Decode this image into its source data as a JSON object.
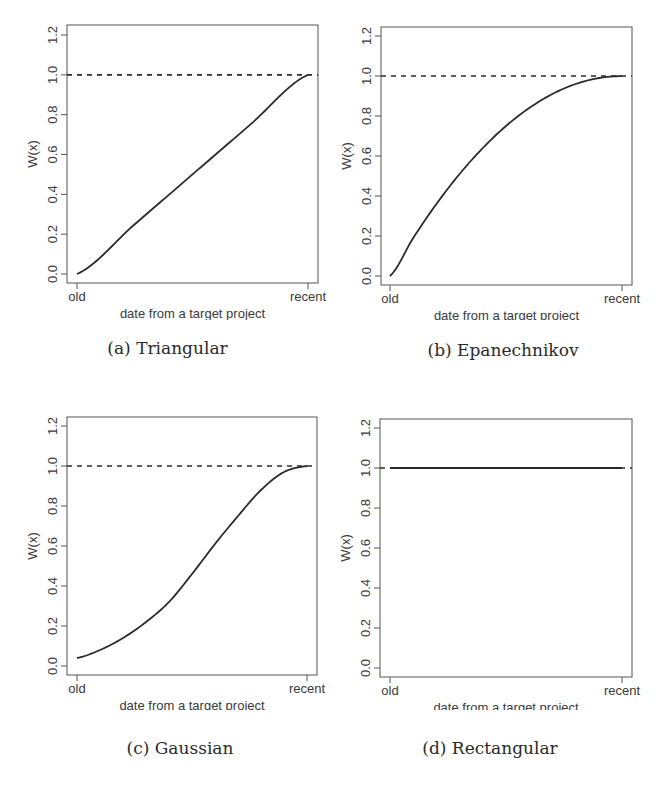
{
  "figure": {
    "panels": [
      {
        "caption": "(a) Triangular"
      },
      {
        "caption": "(b) Epanechnikov"
      },
      {
        "caption": "(c) Gaussian"
      },
      {
        "caption": "(d) Rectangular"
      }
    ]
  },
  "chart_data": [
    {
      "type": "line",
      "title": "(a) Triangular",
      "xlabel": "date from a target project",
      "ylabel": "W(x)",
      "x_tick_labels": [
        "old",
        "recent"
      ],
      "y_ticks": [
        "0.0",
        "0.2",
        "0.4",
        "0.6",
        "0.8",
        "1.0",
        "1.2"
      ],
      "ylim": [
        0,
        1.2
      ],
      "reference_line": {
        "y": 1.0,
        "style": "dashed"
      },
      "x": [
        0,
        0.25,
        0.5,
        0.75,
        1
      ],
      "values": [
        0.0,
        0.25,
        0.5,
        0.75,
        1.0
      ],
      "grid": false
    },
    {
      "type": "line",
      "title": "(b) Epanechnikov",
      "xlabel": "date from a target project",
      "ylabel": "W(x)",
      "x_tick_labels": [
        "old",
        "recent"
      ],
      "y_ticks": [
        "0.0",
        "0.2",
        "0.4",
        "0.6",
        "0.8",
        "1.0",
        "1.2"
      ],
      "ylim": [
        0,
        1.2
      ],
      "reference_line": {
        "y": 1.0,
        "style": "dashed"
      },
      "x": [
        0,
        0.1,
        0.2,
        0.3,
        0.4,
        0.5,
        0.6,
        0.7,
        0.8,
        0.9,
        1
      ],
      "values": [
        0.0,
        0.19,
        0.36,
        0.51,
        0.64,
        0.75,
        0.84,
        0.91,
        0.96,
        0.99,
        1.0
      ],
      "grid": false
    },
    {
      "type": "line",
      "title": "(c) Gaussian",
      "xlabel": "date from a target project",
      "ylabel": "W(x)",
      "x_tick_labels": [
        "old",
        "recent"
      ],
      "y_ticks": [
        "0.0",
        "0.2",
        "0.4",
        "0.6",
        "0.8",
        "1.0",
        "1.2"
      ],
      "ylim": [
        0,
        1.2
      ],
      "reference_line": {
        "y": 1.0,
        "style": "dashed"
      },
      "x": [
        0,
        0.1,
        0.2,
        0.3,
        0.4,
        0.5,
        0.6,
        0.7,
        0.8,
        0.9,
        1
      ],
      "values": [
        0.04,
        0.08,
        0.14,
        0.22,
        0.32,
        0.46,
        0.61,
        0.75,
        0.88,
        0.97,
        1.0
      ],
      "grid": false
    },
    {
      "type": "line",
      "title": "(d) Rectangular",
      "xlabel": "date from a target project",
      "ylabel": "W(x)",
      "x_tick_labels": [
        "old",
        "recent"
      ],
      "y_ticks": [
        "0.0",
        "0.2",
        "0.4",
        "0.6",
        "0.8",
        "1.0",
        "1.2"
      ],
      "ylim": [
        0,
        1.2
      ],
      "reference_line": {
        "y": 1.0,
        "style": "dashed"
      },
      "x": [
        0,
        1
      ],
      "values": [
        1.0,
        1.0
      ],
      "grid": false
    }
  ],
  "style": {
    "line_color": "#2b2b2b",
    "axis_color": "#555555",
    "text_color": "#3a3a3a"
  }
}
